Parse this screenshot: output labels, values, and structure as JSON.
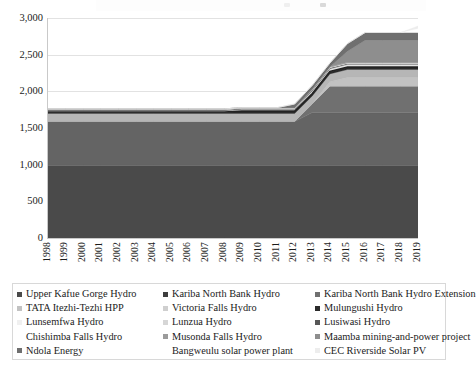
{
  "chart_data": {
    "type": "area",
    "stacked": true,
    "title": "",
    "subtitle": "",
    "xlabel": "",
    "ylabel": "",
    "ylim": [
      0,
      3000
    ],
    "yticks": [
      "0",
      "500",
      "1,000",
      "1,500",
      "2,000",
      "2,500",
      "3,000"
    ],
    "ytick_values": [
      0,
      500,
      1000,
      1500,
      2000,
      2500,
      3000
    ],
    "grid": true,
    "grid_axis": "y",
    "legend_position": "bottom",
    "legend_columns": 3,
    "x": [
      1998,
      1999,
      2000,
      2001,
      2002,
      2003,
      2004,
      2005,
      2006,
      2007,
      2008,
      2009,
      2010,
      2011,
      2012,
      2013,
      2014,
      2015,
      2016,
      2017,
      2018,
      2019
    ],
    "categories": [
      "1998",
      "1999",
      "2000",
      "2001",
      "2002",
      "2003",
      "2004",
      "2005",
      "2006",
      "2007",
      "2008",
      "2009",
      "2010",
      "2011",
      "2012",
      "2013",
      "2014",
      "2015",
      "2016",
      "2017",
      "2018",
      "2019"
    ],
    "series": [
      {
        "name": "Upper Kafue Gorge Hydro",
        "color": "#4a4a4a",
        "values": [
          990,
          990,
          990,
          990,
          990,
          990,
          990,
          990,
          990,
          990,
          990,
          990,
          990,
          990,
          990,
          990,
          990,
          990,
          990,
          990,
          990,
          990
        ]
      },
      {
        "name": "Kariba North Bank Hydro",
        "color": "#646464",
        "values": [
          600,
          600,
          600,
          600,
          600,
          600,
          600,
          600,
          600,
          600,
          600,
          600,
          600,
          600,
          600,
          720,
          720,
          720,
          720,
          720,
          720,
          720
        ]
      },
      {
        "name": "Kariba North Bank Hydro Extension",
        "color": "#707070",
        "values": [
          0,
          0,
          0,
          0,
          0,
          0,
          0,
          0,
          0,
          0,
          0,
          0,
          0,
          0,
          0,
          120,
          360,
          360,
          360,
          360,
          360,
          360
        ]
      },
      {
        "name": "TATA Itezhi-Tezhi HPP",
        "color": "#c2c2c2",
        "values": [
          0,
          0,
          0,
          0,
          0,
          0,
          0,
          0,
          0,
          0,
          0,
          0,
          0,
          0,
          0,
          0,
          60,
          120,
          120,
          120,
          120,
          120
        ]
      },
      {
        "name": "Victoria Falls Hydro",
        "color": "#b6b6b6",
        "values": [
          108,
          108,
          108,
          108,
          108,
          108,
          108,
          108,
          108,
          108,
          108,
          108,
          108,
          108,
          108,
          108,
          108,
          108,
          108,
          108,
          108,
          108
        ]
      },
      {
        "name": "Mulungushi Hydro",
        "color": "#2b2b2b",
        "values": [
          20,
          20,
          20,
          20,
          20,
          20,
          20,
          20,
          20,
          20,
          20,
          32,
          32,
          32,
          32,
          32,
          32,
          32,
          32,
          32,
          32,
          32
        ]
      },
      {
        "name": "Lunsemfwa Hydro",
        "color": "#f0f0f0",
        "values": [
          18,
          18,
          18,
          18,
          18,
          18,
          18,
          18,
          18,
          18,
          18,
          24,
          24,
          24,
          24,
          24,
          24,
          24,
          24,
          24,
          24,
          24
        ]
      },
      {
        "name": "Lunzua Hydro",
        "color": "#d6d6d6",
        "values": [
          0.75,
          0.75,
          0.75,
          0.75,
          0.75,
          0.75,
          0.75,
          0.75,
          0.75,
          0.75,
          0.75,
          0.75,
          0.75,
          0.75,
          0.75,
          14.8,
          14.8,
          14.8,
          14.8,
          14.8,
          14.8,
          14.8
        ]
      },
      {
        "name": "Lusiwasi Hydro",
        "color": "#575757",
        "values": [
          12,
          12,
          12,
          12,
          12,
          12,
          12,
          12,
          12,
          12,
          12,
          12,
          12,
          12,
          12,
          12,
          12,
          12,
          12,
          12,
          12,
          12
        ]
      },
      {
        "name": "Chishimba Falls Hydro",
        "color": "#fafafa",
        "values": [
          6,
          6,
          6,
          6,
          6,
          6,
          6,
          6,
          6,
          6,
          6,
          6,
          6,
          6,
          6,
          6,
          6,
          6,
          6,
          6,
          6,
          6
        ]
      },
      {
        "name": "Musonda Falls Hydro",
        "color": "#9b9b9b",
        "values": [
          5,
          5,
          5,
          5,
          5,
          5,
          5,
          5,
          5,
          5,
          5,
          5,
          5,
          5,
          5,
          5,
          10,
          10,
          10,
          10,
          10,
          10
        ]
      },
      {
        "name": "Maamba mining-and-power project",
        "color": "#8e8e8e",
        "values": [
          0,
          0,
          0,
          0,
          0,
          0,
          0,
          0,
          0,
          0,
          0,
          0,
          0,
          0,
          0,
          0,
          0,
          150,
          300,
          300,
          300,
          300
        ]
      },
      {
        "name": "Ndola Energy",
        "color": "#6f6f6f",
        "values": [
          0,
          0,
          0,
          0,
          0,
          0,
          0,
          0,
          0,
          0,
          0,
          0,
          0,
          0,
          50,
          50,
          50,
          105,
          105,
          105,
          105,
          105
        ]
      },
      {
        "name": "Bangweulu solar power plant",
        "color": "#ffffff",
        "values": [
          0,
          0,
          0,
          0,
          0,
          0,
          0,
          0,
          0,
          0,
          0,
          0,
          0,
          0,
          0,
          0,
          0,
          0,
          0,
          0,
          0,
          54
        ]
      },
      {
        "name": "CEC Riverside Solar PV",
        "color": "#ededed",
        "values": [
          0,
          0,
          0,
          0,
          0,
          0,
          0,
          0,
          0,
          0,
          0,
          0,
          0,
          0,
          0,
          0,
          0,
          0,
          0,
          0,
          0,
          34
        ]
      }
    ],
    "totals": [
      1759.75,
      1759.75,
      1759.75,
      1759.75,
      1759.75,
      1759.75,
      1759.75,
      1759.75,
      1759.75,
      1759.75,
      1759.75,
      1777.75,
      1777.75,
      1777.75,
      1827.75,
      2011.8,
      2297.8,
      2631.8,
      2781.8,
      2781.8,
      2781.8,
      2869.8
    ]
  },
  "legend": {
    "items": [
      {
        "label": "Upper Kafue Gorge Hydro",
        "color": "#4a4a4a"
      },
      {
        "label": "Kariba North Bank Hydro",
        "color": "#3d3d3d"
      },
      {
        "label": "Kariba North Bank Hydro Extension",
        "color": "#707070"
      },
      {
        "label": "TATA Itezhi-Tezhi HPP",
        "color": "#c2c2c2"
      },
      {
        "label": "Victoria Falls Hydro",
        "color": "#cfcfcf"
      },
      {
        "label": "Mulungushi Hydro",
        "color": "#2b2b2b"
      },
      {
        "label": "Lunsemfwa Hydro",
        "color": "#f0f0f0"
      },
      {
        "label": "Lunzua Hydro",
        "color": "#d6d6d6"
      },
      {
        "label": "Lusiwasi Hydro",
        "color": "#575757"
      },
      {
        "label": "Chishimba Falls Hydro",
        "color": "#fafafa"
      },
      {
        "label": "Musonda Falls Hydro",
        "color": "#9b9b9b"
      },
      {
        "label": "Maamba mining-and-power project",
        "color": "#8e8e8e"
      },
      {
        "label": "Ndola Energy",
        "color": "#6f6f6f"
      },
      {
        "label": "Bangweulu solar power plant",
        "color": "#ffffff"
      },
      {
        "label": "CEC Riverside Solar PV",
        "color": "#ededed"
      }
    ]
  },
  "style": {
    "plot_background": "#ffffff",
    "grid_color": "#e2e2e2",
    "axis_color": "#c9c9c9",
    "text_color": "#1b1b1b",
    "legend_border": "#d8d8d8"
  }
}
